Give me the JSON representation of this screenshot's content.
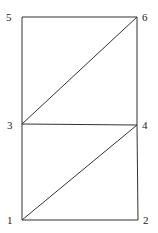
{
  "diagram": {
    "type": "triangulated-mesh",
    "nodes": [
      {
        "id": "1",
        "label": "1",
        "x": 22,
        "y": 220,
        "lx": 7,
        "ly": 224
      },
      {
        "id": "2",
        "label": "2",
        "x": 138,
        "y": 220,
        "lx": 143,
        "ly": 224
      },
      {
        "id": "3",
        "label": "3",
        "x": 22,
        "y": 124,
        "lx": 7,
        "ly": 129
      },
      {
        "id": "4",
        "label": "4",
        "x": 137,
        "y": 125,
        "lx": 142,
        "ly": 129
      },
      {
        "id": "5",
        "label": "5",
        "x": 22,
        "y": 17,
        "lx": 6,
        "ly": 21
      },
      {
        "id": "6",
        "label": "6",
        "x": 137,
        "y": 17,
        "lx": 142,
        "ly": 21
      }
    ],
    "edges": [
      [
        "1",
        "2"
      ],
      [
        "2",
        "4"
      ],
      [
        "4",
        "3"
      ],
      [
        "3",
        "1"
      ],
      [
        "1",
        "4"
      ],
      [
        "3",
        "5"
      ],
      [
        "5",
        "6"
      ],
      [
        "6",
        "4"
      ],
      [
        "3",
        "6"
      ]
    ]
  }
}
